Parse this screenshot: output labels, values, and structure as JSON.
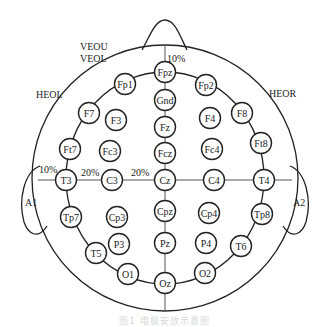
{
  "diagram": {
    "type": "eeg-electrode-placement",
    "system": "10-20",
    "labels": {
      "veou": "VEOU",
      "veol": "VEOL",
      "heol": "HEOL",
      "heor": "HEOR",
      "a1": "A1",
      "a2": "A2",
      "pct_top": "10%",
      "pct_left": "10%",
      "pct_t3_c3": "20%",
      "pct_c3_cz": "20%"
    },
    "electrodes": [
      {
        "id": "Fpz",
        "x": 165,
        "y": 72
      },
      {
        "id": "Gnd",
        "x": 165,
        "y": 100
      },
      {
        "id": "Fz",
        "x": 165,
        "y": 127
      },
      {
        "id": "Fcz",
        "x": 165,
        "y": 153
      },
      {
        "id": "Cz",
        "x": 165,
        "y": 180
      },
      {
        "id": "Cpz",
        "x": 165,
        "y": 211
      },
      {
        "id": "Pz",
        "x": 165,
        "y": 243
      },
      {
        "id": "Oz",
        "x": 165,
        "y": 283
      },
      {
        "id": "Fp1",
        "x": 125,
        "y": 84
      },
      {
        "id": "Fp2",
        "x": 206,
        "y": 85
      },
      {
        "id": "F7",
        "x": 89,
        "y": 113
      },
      {
        "id": "F3",
        "x": 116,
        "y": 120
      },
      {
        "id": "F4",
        "x": 210,
        "y": 118
      },
      {
        "id": "F8",
        "x": 242,
        "y": 113
      },
      {
        "id": "Ft7",
        "x": 70,
        "y": 149
      },
      {
        "id": "Fc3",
        "x": 110,
        "y": 151
      },
      {
        "id": "Fc4",
        "x": 212,
        "y": 149
      },
      {
        "id": "Ft8",
        "x": 261,
        "y": 143
      },
      {
        "id": "T3",
        "x": 66,
        "y": 180
      },
      {
        "id": "C3",
        "x": 112,
        "y": 180
      },
      {
        "id": "C4",
        "x": 214,
        "y": 180
      },
      {
        "id": "T4",
        "x": 264,
        "y": 180
      },
      {
        "id": "Tp7",
        "x": 71,
        "y": 217
      },
      {
        "id": "Cp3",
        "x": 117,
        "y": 217
      },
      {
        "id": "Cp4",
        "x": 209,
        "y": 213
      },
      {
        "id": "Tp8",
        "x": 262,
        "y": 214
      },
      {
        "id": "T5",
        "x": 96,
        "y": 253
      },
      {
        "id": "P3",
        "x": 119,
        "y": 244
      },
      {
        "id": "P4",
        "x": 206,
        "y": 243
      },
      {
        "id": "T6",
        "x": 241,
        "y": 246
      },
      {
        "id": "O1",
        "x": 128,
        "y": 274
      },
      {
        "id": "O2",
        "x": 205,
        "y": 273
      }
    ],
    "caption": "图1 电极安放示意图"
  }
}
